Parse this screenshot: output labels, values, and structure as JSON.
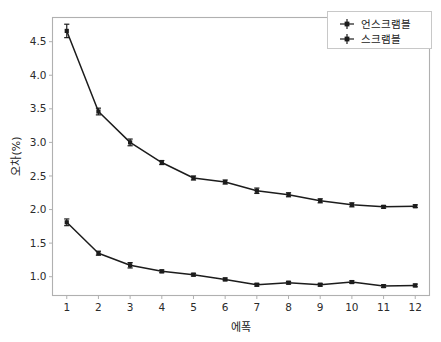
{
  "chart_data": {
    "type": "line",
    "title": "",
    "xlabel": "에폭",
    "ylabel": "오차(%)",
    "x": [
      1,
      2,
      3,
      4,
      5,
      6,
      7,
      8,
      9,
      10,
      11,
      12
    ],
    "xtick_labels": [
      "1",
      "2",
      "3",
      "4",
      "5",
      "6",
      "7",
      "8",
      "9",
      "10",
      "11",
      "12"
    ],
    "ytick_labels": [
      "1.0",
      "1.5",
      "2.0",
      "2.5",
      "3.0",
      "3.5",
      "4.0",
      "4.5"
    ],
    "ytick_values": [
      1.0,
      1.5,
      2.0,
      2.5,
      3.0,
      3.5,
      4.0,
      4.5
    ],
    "xlim": [
      0.55,
      12.45
    ],
    "ylim": [
      0.72,
      4.86
    ],
    "grid": false,
    "legend_position": "upper right",
    "marker": "square",
    "errorbars": true,
    "series": [
      {
        "name": "언스크램블",
        "color": "#1c1c1c",
        "values": [
          1.81,
          1.35,
          1.17,
          1.08,
          1.03,
          0.96,
          0.88,
          0.91,
          0.88,
          0.92,
          0.86,
          0.87
        ],
        "errors": [
          0.05,
          0.03,
          0.04,
          0.02,
          0.02,
          0.02,
          0.02,
          0.02,
          0.02,
          0.02,
          0.02,
          0.02
        ]
      },
      {
        "name": "스크램블",
        "color": "#1c1c1c",
        "values": [
          4.66,
          3.46,
          3.0,
          2.7,
          2.47,
          2.41,
          2.28,
          2.22,
          2.13,
          2.07,
          2.04,
          2.05
        ],
        "errors": [
          0.1,
          0.05,
          0.05,
          0.03,
          0.03,
          0.03,
          0.04,
          0.03,
          0.03,
          0.03,
          0.02,
          0.02
        ]
      }
    ]
  },
  "legend": {
    "entries": [
      {
        "label": "언스크램블"
      },
      {
        "label": "스크램블"
      }
    ]
  },
  "axes": {
    "y_title": "오차(%)",
    "x_title": "에폭"
  }
}
